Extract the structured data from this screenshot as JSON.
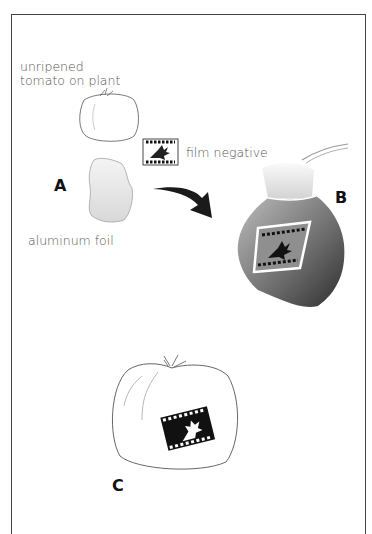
{
  "diagram": {
    "labels": {
      "tomato_plant_line1": "unripened",
      "tomato_plant_line2": "tomato on plant",
      "film": "film negative",
      "foil": "aluminum foil"
    },
    "steps": [
      "A",
      "B",
      "C"
    ]
  }
}
